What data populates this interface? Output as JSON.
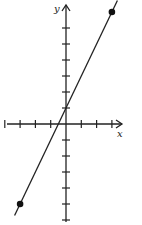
{
  "chart_data": {
    "type": "line",
    "title": "",
    "xlabel": "x",
    "ylabel": "y",
    "equation_implied": "y = 2x + 1",
    "series": [
      {
        "name": "line",
        "x": [
          -3,
          3
        ],
        "y": [
          -5,
          7
        ],
        "endpoints_marked": true
      }
    ],
    "x_ticks": [
      -4,
      -3,
      -2,
      -1,
      1,
      2,
      3
    ],
    "y_ticks": [
      -6,
      -5,
      -4,
      -3,
      -2,
      -1,
      1,
      2,
      3,
      4,
      5,
      6
    ],
    "xlim": [
      -4.3,
      3.6
    ],
    "ylim": [
      -6.3,
      7.5
    ],
    "grid": false,
    "legend": null
  },
  "labels": {
    "x_axis": "x",
    "y_axis": "y"
  }
}
